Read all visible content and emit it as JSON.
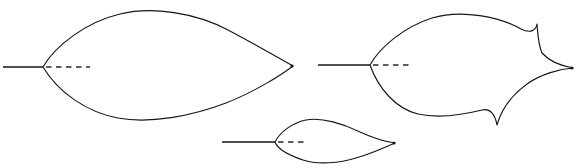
{
  "figure": {
    "background_color": "#ffffff",
    "stroke_color": "#16161a",
    "dash_color": "#2a2a2e",
    "width": 582,
    "height": 168
  },
  "chart_data": {
    "type": "line",
    "title": "",
    "subtitle": "",
    "xlabel": "",
    "ylabel": "",
    "grid": false,
    "legend": null,
    "axis_ranges": {
      "x": [
        0,
        582
      ],
      "y": [
        0,
        168
      ]
    },
    "series": [
      {
        "name": "large-smooth-lens-outline",
        "shape": "lens-cusped-left-and-right",
        "path": "M 43 67 C 55 46 86 22 120 14 C 152 6 196 13 228 30 C 262 48 282 60 293 66 C 280 76 254 92 226 103 C 192 116 150 124 118 118 C 86 112 58 92 43 67 Z",
        "left_cusp": [
          43,
          67
        ],
        "right_cusp": [
          293,
          66
        ],
        "top_extreme": [
          155,
          10
        ],
        "bottom_extreme": [
          148,
          122
        ],
        "axis_solid": {
          "x1": 3,
          "y1": 67,
          "x2": 43,
          "y2": 67
        },
        "axis_dashed": {
          "x1": 46,
          "y1": 67,
          "x2": 90,
          "y2": 67
        }
      },
      {
        "name": "large-concave-cusped-outline",
        "shape": "fish-like-with-three-cusps",
        "path": "M 370 65 C 380 47 404 27 432 18 C 462 9 500 17 521 29 C 531 34 536 30 537 24 C 538 34 538 44 542 53 C 550 62 562 66 573 68 C 560 69 541 74 527 84 C 512 95 501 110 497 125 C 495 114 490 108 482 110 C 466 114 440 119 418 114 C 396 109 378 88 370 65 Z",
        "left_cusp": [
          370,
          65
        ],
        "right_cusp": [
          573,
          68
        ],
        "upper_cusp": [
          537,
          24
        ],
        "lower_cusp": [
          497,
          125
        ],
        "top_extreme": [
          460,
          14
        ],
        "bottom_extreme": [
          470,
          120
        ],
        "axis_solid": {
          "x1": 318,
          "y1": 65,
          "x2": 370,
          "y2": 65
        },
        "axis_dashed": {
          "x1": 373,
          "y1": 65,
          "x2": 410,
          "y2": 65
        }
      },
      {
        "name": "small-smooth-lens-outline",
        "shape": "lens-cusped-left-and-right",
        "path": "M 275 142 C 280 132 292 123 306 120 C 322 117 344 124 360 132 C 375 139 388 142 395 143 C 386 147 370 154 356 158 C 340 163 318 165 303 160 C 288 155 278 150 275 142 Z",
        "left_cusp": [
          275,
          142
        ],
        "right_cusp": [
          395,
          143
        ],
        "top_extreme": [
          322,
          119
        ],
        "bottom_extreme": [
          335,
          164
        ],
        "axis_solid": {
          "x1": 222,
          "y1": 142,
          "x2": 275,
          "y2": 142
        },
        "axis_dashed": {
          "x1": 278,
          "y1": 142,
          "x2": 305,
          "y2": 142
        }
      }
    ]
  }
}
